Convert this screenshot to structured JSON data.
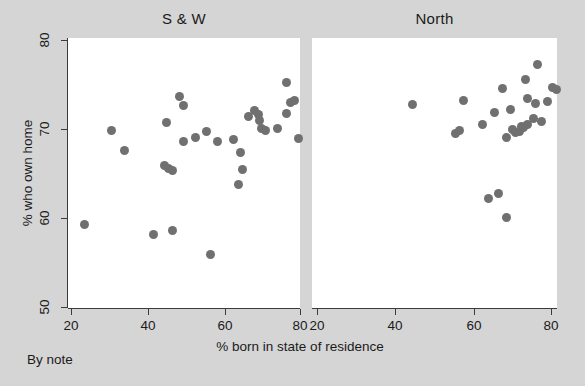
{
  "figure": {
    "background_color": "#d5d5d5",
    "panel_color": "#ffffff",
    "marker_color": "#707070",
    "axis_color": "#3b3b3b",
    "note": "By note"
  },
  "labels": {
    "xlabel": "% born in state of residence",
    "ylabel": "% who own home",
    "panel_left_title": "S & W",
    "panel_right_title": "North"
  },
  "axes": {
    "y_ticks": [
      "50",
      "60",
      "70",
      "80"
    ],
    "x_ticks_left": [
      "20",
      "40",
      "60",
      "80"
    ],
    "x_ticks_right": [
      "20",
      "40",
      "60",
      "80"
    ]
  },
  "chart_data": {
    "type": "scatter",
    "title": "",
    "xlabel": "% born in state of residence",
    "ylabel": "% who own home",
    "xlim": [
      15,
      85
    ],
    "ylim": [
      50,
      80
    ],
    "grid": false,
    "legend": null,
    "panels": [
      {
        "name": "S & W",
        "x_ticks": [
          20,
          40,
          60,
          80
        ],
        "y_ticks": [
          50,
          60,
          70,
          80
        ],
        "points": [
          {
            "x": 23.5,
            "y": 59.3
          },
          {
            "x": 30.5,
            "y": 69.8
          },
          {
            "x": 34.0,
            "y": 67.6
          },
          {
            "x": 41.5,
            "y": 58.1
          },
          {
            "x": 44.5,
            "y": 65.9
          },
          {
            "x": 45.5,
            "y": 65.6
          },
          {
            "x": 46.5,
            "y": 65.3
          },
          {
            "x": 45.0,
            "y": 70.7
          },
          {
            "x": 46.5,
            "y": 58.6
          },
          {
            "x": 48.5,
            "y": 73.6
          },
          {
            "x": 49.5,
            "y": 72.6
          },
          {
            "x": 49.5,
            "y": 68.6
          },
          {
            "x": 52.5,
            "y": 69.0
          },
          {
            "x": 56.5,
            "y": 55.9
          },
          {
            "x": 55.5,
            "y": 69.7
          },
          {
            "x": 58.5,
            "y": 68.6
          },
          {
            "x": 62.5,
            "y": 68.8
          },
          {
            "x": 64.5,
            "y": 67.4
          },
          {
            "x": 65.0,
            "y": 65.4
          },
          {
            "x": 64.0,
            "y": 63.8
          },
          {
            "x": 66.5,
            "y": 71.4
          },
          {
            "x": 68.0,
            "y": 72.1
          },
          {
            "x": 69.0,
            "y": 71.6
          },
          {
            "x": 69.5,
            "y": 70.9
          },
          {
            "x": 70.0,
            "y": 70.1
          },
          {
            "x": 71.0,
            "y": 69.8
          },
          {
            "x": 74.0,
            "y": 70.1
          },
          {
            "x": 76.5,
            "y": 75.2
          },
          {
            "x": 77.5,
            "y": 73.0
          },
          {
            "x": 78.5,
            "y": 73.2
          },
          {
            "x": 76.5,
            "y": 71.7
          },
          {
            "x": 79.5,
            "y": 68.9
          }
        ]
      },
      {
        "name": "North",
        "x_ticks": [
          20,
          40,
          60,
          80
        ],
        "y_ticks": [
          50,
          60,
          70,
          80
        ],
        "points": [
          {
            "x": 44.5,
            "y": 72.8
          },
          {
            "x": 55.5,
            "y": 69.5
          },
          {
            "x": 56.5,
            "y": 69.8
          },
          {
            "x": 57.5,
            "y": 73.2
          },
          {
            "x": 62.5,
            "y": 70.5
          },
          {
            "x": 64.0,
            "y": 62.2
          },
          {
            "x": 65.5,
            "y": 71.8
          },
          {
            "x": 66.5,
            "y": 62.8
          },
          {
            "x": 67.5,
            "y": 74.6
          },
          {
            "x": 68.5,
            "y": 60.1
          },
          {
            "x": 68.5,
            "y": 69.0
          },
          {
            "x": 69.5,
            "y": 72.2
          },
          {
            "x": 70.0,
            "y": 70.0
          },
          {
            "x": 70.8,
            "y": 69.6
          },
          {
            "x": 71.8,
            "y": 69.7
          },
          {
            "x": 72.5,
            "y": 70.3
          },
          {
            "x": 73.0,
            "y": 70.2
          },
          {
            "x": 73.5,
            "y": 75.6
          },
          {
            "x": 74.0,
            "y": 73.4
          },
          {
            "x": 74.0,
            "y": 70.5
          },
          {
            "x": 75.5,
            "y": 71.2
          },
          {
            "x": 76.0,
            "y": 72.9
          },
          {
            "x": 76.5,
            "y": 77.3
          },
          {
            "x": 77.5,
            "y": 70.8
          },
          {
            "x": 79.0,
            "y": 73.1
          },
          {
            "x": 80.5,
            "y": 74.7
          },
          {
            "x": 81.5,
            "y": 74.4
          }
        ]
      }
    ]
  }
}
